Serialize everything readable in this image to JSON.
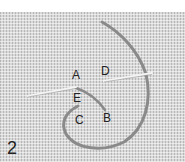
{
  "figure": {
    "step_number": "2",
    "labels": {
      "A": "A",
      "B": "B",
      "C": "C",
      "D": "D",
      "E": "E"
    },
    "colors": {
      "fabric": "#d9d9d9",
      "thread": "#8a8a8a",
      "needle": "#f2f2f2",
      "text": "#222222"
    }
  }
}
